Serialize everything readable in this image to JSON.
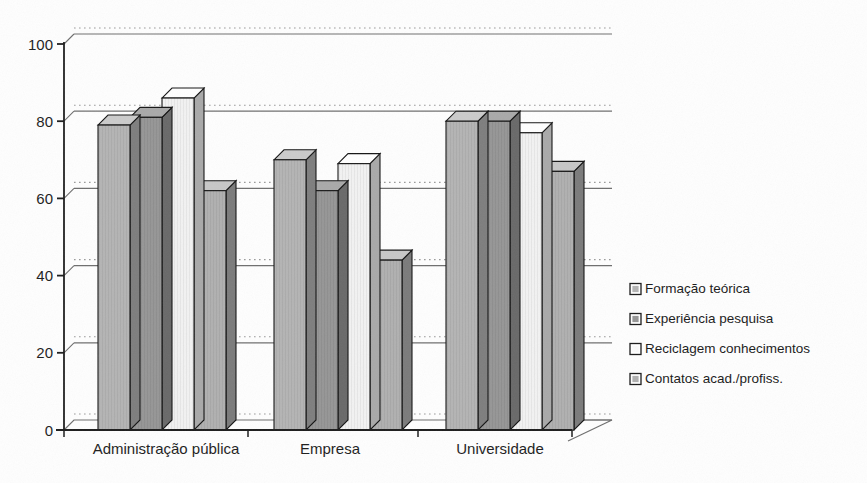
{
  "chart_data": {
    "type": "bar",
    "title": "",
    "subtitle": "",
    "xlabel": "",
    "ylabel": "",
    "categories": [
      "Administração pública",
      "Empresa",
      "Universidade"
    ],
    "series": [
      {
        "name": "Formação teórica",
        "values": [
          79,
          70,
          80
        ],
        "color": "#b4b4b4"
      },
      {
        "name": "Experiência pesquisa",
        "values": [
          81,
          62,
          80
        ],
        "color": "#969696"
      },
      {
        "name": "Reciclagem conhecimentos",
        "values": [
          86,
          69,
          77
        ],
        "color": "#f2f2f2"
      },
      {
        "name": "Contatos acad./profiss.",
        "values": [
          62,
          44,
          67
        ],
        "color": "#b0b0b0"
      }
    ],
    "ylim": [
      0,
      100
    ],
    "yticks": [
      0,
      20,
      40,
      60,
      80,
      100
    ],
    "ytick_labels": [
      "0",
      "20",
      "40",
      "60",
      "80",
      "100"
    ],
    "grid": true,
    "grid_style": "solid back-wall lines with dotted front-plane projections",
    "legend_position": "right",
    "render_style": "3d-grouped-bars-grayscale"
  },
  "axis": {
    "y_labels": [
      "100",
      "80",
      "60",
      "40",
      "20",
      "0"
    ],
    "x_labels": [
      "Administração pública",
      "Empresa",
      "Universidade"
    ]
  },
  "legend": {
    "items": [
      {
        "label": "Formação teórica",
        "swatch": "#b4b4b4"
      },
      {
        "label": "Experiência pesquisa",
        "swatch": "#969696"
      },
      {
        "label": "Reciclagem conhecimentos",
        "swatch": "#fafafa"
      },
      {
        "label": "Contatos acad./profiss.",
        "swatch": "#b0b0b0"
      }
    ]
  },
  "colors": {
    "axis": "#1d1d1d",
    "gridline_solid": "#6e6e6e",
    "gridline_dotted": "#9a9a9a",
    "background": "#fefefe"
  }
}
